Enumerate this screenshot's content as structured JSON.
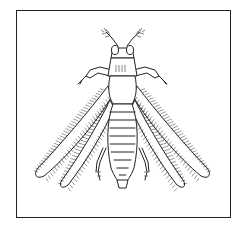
{
  "illustration": {
    "subject": "thrips insect",
    "view": "dorsal",
    "style": "black line drawing",
    "colors": {
      "line": "#222222",
      "background": "#ffffff",
      "frame": "#222222"
    },
    "parts": [
      "antennae",
      "head",
      "eyes",
      "pronotum",
      "forelegs",
      "thorax",
      "fringed wings",
      "abdomen",
      "hind legs"
    ]
  }
}
